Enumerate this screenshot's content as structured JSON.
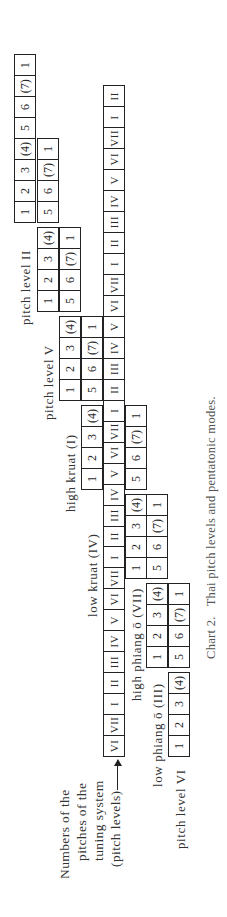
{
  "chart": {
    "caption_number": "Chart 2.",
    "caption_text": "Thai pitch levels and pentatonic modes.",
    "legend_lines": [
      "Numbers of the",
      "pitches of the",
      "tuning system",
      "(pitch levels)"
    ],
    "main_row": [
      "VI",
      "VII",
      "I",
      "II",
      "III",
      "IV",
      "V",
      "VI",
      "VII",
      "I",
      "II",
      "III",
      "IV",
      "V",
      "VI",
      "VII",
      "I",
      "II",
      "III",
      "IV",
      "V",
      "VI",
      "VII",
      "I",
      "II",
      "III",
      "IV",
      "V",
      "VI",
      "VII",
      "I",
      "II"
    ],
    "modes": [
      {
        "label": "pitch level VI",
        "start_index": 0,
        "degrees": [
          "1",
          "2",
          "3",
          "(4)",
          "5",
          "6",
          "(7)",
          "1"
        ]
      },
      {
        "label": "low phiang ō (III)",
        "start_index": 4,
        "degrees": [
          "1",
          "2",
          "3",
          "(4)",
          "5",
          "6",
          "(7)",
          "1"
        ]
      },
      {
        "label": "high phiang ō (VII)",
        "start_index": 8,
        "degrees": [
          "1",
          "2",
          "3",
          "(4)",
          "5",
          "6",
          "(7)",
          "1"
        ]
      },
      {
        "label": "low kruat (IV)",
        "start_index": 12,
        "degrees": [
          "1",
          "2",
          "3",
          "(4)",
          "5",
          "6",
          "(7)",
          "1"
        ]
      },
      {
        "label": "high kruat (I)",
        "start_index": 16,
        "degrees": [
          "1",
          "2",
          "3",
          "(4)",
          "5",
          "6",
          "(7)",
          "1"
        ]
      },
      {
        "label": "pitch level V",
        "start_index": 20,
        "degrees": [
          "1",
          "2",
          "3",
          "(4)",
          "5",
          "6",
          "(7)",
          "1"
        ]
      },
      {
        "label": "pitch level II",
        "start_index": 24,
        "degrees": [
          "1",
          "2",
          "3",
          "(4)",
          "5",
          "6",
          "(7)",
          "1"
        ]
      }
    ]
  }
}
